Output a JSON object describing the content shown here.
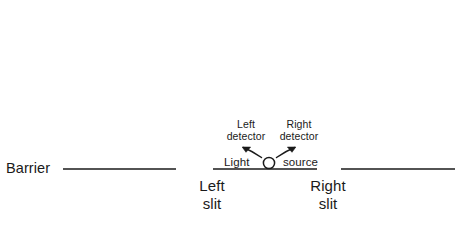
{
  "diagram": {
    "background_color": "#ffffff",
    "ink_color": "#1a1a1a",
    "labels": {
      "barrier": "Barrier",
      "detector_left_line1": "Left",
      "detector_left_line2": "detector",
      "detector_right_line1": "Right",
      "detector_right_line2": "detector",
      "light_word": "Light",
      "source_word": "source",
      "slit_left_line1": "Left",
      "slit_left_line2": "slit",
      "slit_right_line1": "Right",
      "slit_right_line2": "slit"
    },
    "icons": {
      "light_source": "open-circle-icon",
      "arrow_left": "curved-arrow-up-left-icon",
      "arrow_right": "curved-arrow-up-right-icon"
    },
    "geometry": {
      "barrier_y": 169,
      "barrier_segments": [
        {
          "name": "left-barrier-segment",
          "x1": 63,
          "x2": 176
        },
        {
          "name": "center-barrier-segment",
          "x1": 213,
          "x2": 317
        },
        {
          "name": "right-barrier-segment",
          "x1": 341,
          "x2": 455
        }
      ],
      "slits": [
        {
          "name": "left-slit",
          "x1": 176,
          "x2": 213
        },
        {
          "name": "right-slit",
          "x1": 317,
          "x2": 341
        }
      ],
      "light_source_circle": {
        "cx": 269,
        "cy": 163,
        "r": 5.6
      }
    }
  }
}
